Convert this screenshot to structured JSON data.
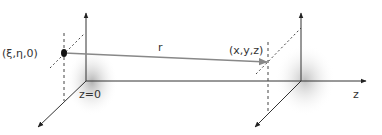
{
  "diagram": {
    "labels": {
      "source_point": "(ξ,η,0)",
      "field_point": "(x,y,z)",
      "distance": "r",
      "plane": "z=0",
      "axis": "z"
    },
    "colors": {
      "axis": "#333333",
      "ray": "#888888",
      "dashed": "#444444",
      "point": "#111111",
      "shadow": "#9a9a9a"
    }
  }
}
